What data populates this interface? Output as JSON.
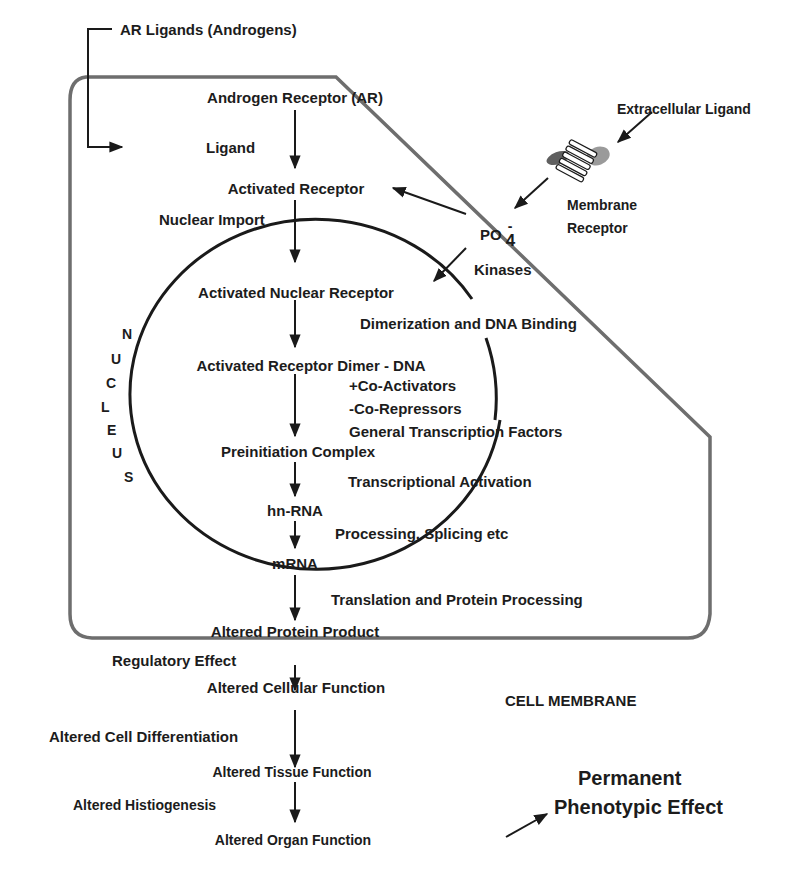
{
  "diagram": {
    "type": "androgen-receptor-signaling-pathway",
    "main_flow": [
      "Androgen Receptor (AR)",
      "Activated Receptor",
      "Activated Nuclear Receptor",
      "Activated Receptor Dimer - DNA",
      "Preinitiation Complex",
      "hn-RNA",
      "mRNA",
      "Altered Protein Product",
      "Altered Cellular Function",
      "Altered Tissue Function",
      "Altered Organ Function"
    ],
    "labels": {
      "ar_ligands": "AR Ligands (Androgens)",
      "androgen_receptor": "Androgen Receptor (AR)",
      "ligand": "Ligand",
      "activated_receptor": "Activated Receptor",
      "nuclear_import": "Nuclear Import",
      "extracellular_ligand": "Extracellular Ligand",
      "membrane_receptor_line1": "Membrane",
      "membrane_receptor_line2": "Receptor",
      "po4_base": "PO",
      "po4_subscript": "4",
      "po4_superscript": "-",
      "kinases": "Kinases",
      "activated_nuclear_receptor": "Activated Nuclear Receptor",
      "dimerization": "Dimerization and DNA Binding",
      "receptor_dimer_dna": "Activated Receptor Dimer - DNA",
      "co_activators": "+Co-Activators",
      "co_repressors": "-Co-Repressors",
      "general_tf": "General Transcription Factors",
      "preinitiation": "Preinitiation Complex",
      "transcriptional_activation": "Transcriptional Activation",
      "hn_rna": "hn-RNA",
      "processing_splicing": "Processing, Splicing etc",
      "mrna": "mRNA",
      "translation": "Translation and Protein Processing",
      "altered_protein": "Altered Protein Product",
      "regulatory_effect": "Regulatory Effect",
      "altered_cellular": "Altered Cellular Function",
      "cell_membrane": "CELL MEMBRANE",
      "altered_cell_diff": "Altered Cell Differentiation",
      "altered_tissue": "Altered Tissue Function",
      "altered_histiogenesis": "Altered Histiogenesis",
      "altered_organ": "Altered Organ Function",
      "permanent_line1": "Permanent",
      "permanent_line2": "Phenotypic Effect"
    },
    "nucleus_letters": [
      "N",
      "U",
      "C",
      "L",
      "E",
      "U",
      "S"
    ],
    "colors": {
      "line": "#1a1a1a",
      "membrane": "#6b6b6b",
      "receptor_blob": "#7a7a7a",
      "background": "#ffffff"
    }
  }
}
